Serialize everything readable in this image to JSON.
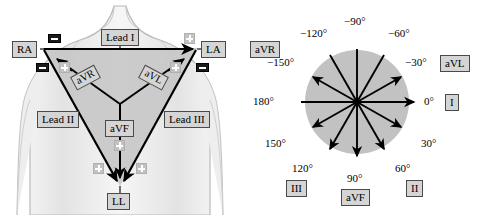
{
  "figure": {
    "colors": {
      "torso_outline": "#b9b9b9",
      "triangle_fill": "#c8c8c8",
      "circle_fill": "#c2c2c2",
      "vector_stroke": "#000000",
      "label_box_fill": "#d5d5d5",
      "label_box_border": "#4a4a4a",
      "electrode_negative": "#1a1a1a",
      "electrode_positive": "#c2c2c2"
    }
  },
  "einthoven": {
    "panel_name": "Einthoven triangle on torso",
    "electrode_labels": {
      "right_arm": "RA",
      "left_arm": "LA",
      "left_leg": "LL"
    },
    "bipolar_leads": [
      {
        "label": "Lead I",
        "from": "RA",
        "to": "LA",
        "axis_deg": 0
      },
      {
        "label": "Lead II",
        "from": "RA",
        "to": "LL",
        "axis_deg": 60
      },
      {
        "label": "Lead III",
        "from": "LA",
        "to": "LL",
        "axis_deg": 120
      }
    ],
    "augmented_leads": [
      {
        "label": "aVR",
        "axis_deg": -150
      },
      {
        "label": "aVL",
        "axis_deg": -30
      },
      {
        "label": "aVF",
        "axis_deg": 90
      }
    ],
    "electrode_polarity_markers": {
      "negative_symbol": "−",
      "positive_symbol": "+",
      "negative_count": 4,
      "positive_count": 6
    }
  },
  "hexaxial": {
    "panel_name": "Hexaxial reference system",
    "center_label": "",
    "axes": [
      {
        "angle_label": "−90°",
        "degrees": -90,
        "lead": "aVR-negative"
      },
      {
        "angle_label": "−120°",
        "degrees": -120,
        "lead": ""
      },
      {
        "angle_label": "−150°",
        "degrees": -150,
        "lead": "aVR"
      },
      {
        "angle_label": "180°",
        "degrees": 180,
        "lead": ""
      },
      {
        "angle_label": "150°",
        "degrees": 150,
        "lead": ""
      },
      {
        "angle_label": "120°",
        "degrees": 120,
        "lead": "III"
      },
      {
        "angle_label": "90°",
        "degrees": 90,
        "lead": "aVF"
      },
      {
        "angle_label": "60°",
        "degrees": 60,
        "lead": "II"
      },
      {
        "angle_label": "30°",
        "degrees": 30,
        "lead": ""
      },
      {
        "angle_label": "0°",
        "degrees": 0,
        "lead": "I"
      },
      {
        "angle_label": "−30°",
        "degrees": -30,
        "lead": "aVL"
      },
      {
        "angle_label": "−60°",
        "degrees": -60,
        "lead": ""
      }
    ],
    "lead_boxes": [
      {
        "label": "aVR",
        "degrees": -150
      },
      {
        "label": "aVL",
        "degrees": -30
      },
      {
        "label": "I",
        "degrees": 0
      },
      {
        "label": "II",
        "degrees": 60
      },
      {
        "label": "aVF",
        "degrees": 90
      },
      {
        "label": "III",
        "degrees": 120
      }
    ],
    "arrow_directions_deg": [
      0,
      30,
      60,
      90,
      120,
      150,
      180,
      -150,
      -120,
      -90,
      -60,
      -30
    ],
    "arrowheads_at_deg": [
      0,
      30,
      60,
      90,
      120,
      150,
      -150,
      -120,
      -90,
      -60,
      -30
    ]
  }
}
